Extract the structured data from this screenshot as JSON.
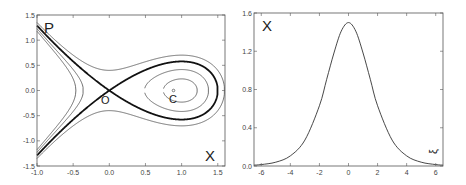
{
  "chart_data": [
    {
      "type": "line",
      "title": "",
      "description": "Phase portrait: level curves of H = P^2/2 - X^2/2 + X^3/3; bold curve is homoclinic separatrix (H=0) through saddle O",
      "xlabel": "X",
      "ylabel": "P",
      "xlim": [
        -1.0,
        1.6
      ],
      "ylim": [
        -1.5,
        1.5
      ],
      "xticks": [
        "-1.0",
        "-0.5",
        "0.0",
        "0.5",
        "1.0",
        "1.5"
      ],
      "yticks": [
        "-1.5",
        "-1.0",
        "-0.5",
        "0.0",
        "0.5",
        "1.0",
        "1.5"
      ],
      "grid": false,
      "series": [
        {
          "name": "H=-0.14",
          "level": -0.14,
          "style": "thin"
        },
        {
          "name": "H=-0.08",
          "level": -0.08,
          "style": "thin"
        },
        {
          "name": "H=0 separatrix",
          "level": 0.0,
          "style": "bold"
        },
        {
          "name": "H=0.08",
          "level": 0.08,
          "style": "thin"
        }
      ],
      "annotations": [
        {
          "text": "O",
          "x": 0.0,
          "y": 0.0,
          "meaning": "saddle point"
        },
        {
          "text": "C",
          "x": 1.0,
          "y": 0.0,
          "meaning": "center"
        }
      ]
    },
    {
      "type": "line",
      "title": "",
      "description": "Homoclinic solution X(xi) = 1.5 sech^2(xi/2)",
      "xlabel": "ξ",
      "ylabel": "X",
      "xlim": [
        -6.5,
        6.5
      ],
      "ylim": [
        0.0,
        1.6
      ],
      "xticks": [
        "-6",
        "-4",
        "-2",
        "0",
        "2",
        "4",
        "6"
      ],
      "yticks": [
        "0.0",
        "0.4",
        "0.8",
        "1.2",
        "1.6"
      ],
      "grid": false,
      "series": [
        {
          "name": "X(ξ)",
          "x": [
            -6.5,
            -6,
            -5,
            -4,
            -3,
            -2,
            -1.5,
            -1,
            -0.5,
            0,
            0.5,
            1,
            1.5,
            2,
            3,
            4,
            5,
            6,
            6.5
          ],
          "y": [
            0.009,
            0.015,
            0.04,
            0.106,
            0.271,
            0.63,
            0.907,
            1.182,
            1.41,
            1.5,
            1.41,
            1.182,
            0.907,
            0.63,
            0.271,
            0.106,
            0.04,
            0.015,
            0.009
          ]
        }
      ]
    }
  ],
  "left_panel": {
    "ylabel": "P",
    "xlabel": "X",
    "saddle_label": "O",
    "center_label": "C",
    "xticks": [
      "-1.0",
      "-0.5",
      "0.0",
      "0.5",
      "1.0",
      "1.5"
    ],
    "yticks": [
      "1.5",
      "1.0",
      "0.5",
      "0.0",
      "-0.5",
      "-1.0",
      "-1.5"
    ]
  },
  "right_panel": {
    "ylabel": "X",
    "xlabel": "ξ",
    "xticks": [
      "-6",
      "-4",
      "-2",
      "0",
      "2",
      "4",
      "6"
    ],
    "yticks": [
      "1.6",
      "1.2",
      "0.8",
      "0.4",
      "0.0"
    ]
  },
  "colors": {
    "axis": "#555555",
    "curve": "#333333",
    "bold_curve": "#111111",
    "text": "#222222"
  }
}
